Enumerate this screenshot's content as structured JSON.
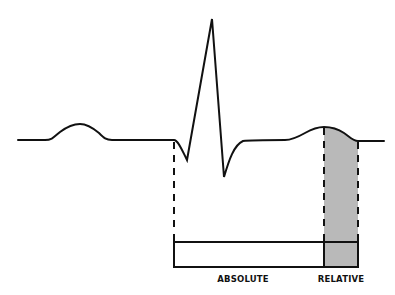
{
  "diagram": {
    "type": "ecg-refractory-period",
    "trace_color": "#111111",
    "shade_color": "#b9b9b9",
    "waveform": {
      "segments": [
        "P wave",
        "QRS complex",
        "T wave"
      ]
    },
    "bar": {
      "segments": [
        {
          "id": "absolute",
          "label": "ABSOLUTE",
          "shaded": false
        },
        {
          "id": "relative",
          "label": "RELATIVE",
          "shaded": true
        }
      ]
    }
  }
}
